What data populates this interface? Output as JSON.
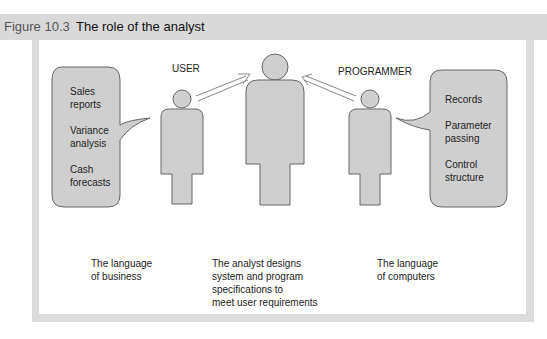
{
  "figure": {
    "label": "Figure 10.3",
    "title": "The role of the analyst"
  },
  "roles": {
    "user": "USER",
    "programmer": "PROGRAMMER"
  },
  "left_bubble": {
    "items": [
      "Sales",
      "reports",
      "Variance",
      "analysis",
      "Cash",
      "forecasts"
    ]
  },
  "right_bubble": {
    "items": [
      "Records",
      "Parameter",
      "passing",
      "Control",
      "structure"
    ]
  },
  "captions": {
    "left": [
      "The language",
      "of business"
    ],
    "center": [
      "The analyst designs",
      "system and program",
      "specifications to",
      "meet user requirements"
    ],
    "right": [
      "The language",
      "of computers"
    ]
  },
  "colors": {
    "title_bar": "#d9d9d9",
    "frame": "#dcdcdc",
    "figure_fill": "#cfcfcf",
    "outline": "#666666"
  }
}
